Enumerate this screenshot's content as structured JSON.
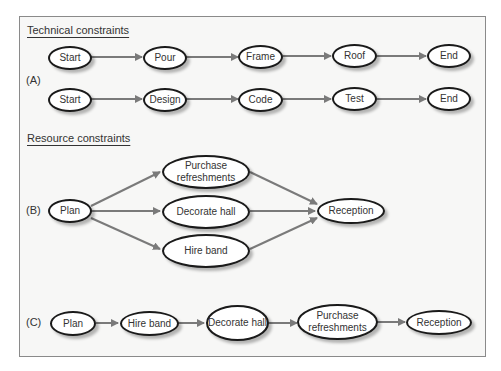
{
  "headers": {
    "technical": "Technical constraints",
    "resource": "Resource constraints"
  },
  "section_labels": {
    "a": "(A)",
    "b": "(B)",
    "c": "(C)"
  },
  "colors": {
    "arrow": "#7a7a7a",
    "node_border": "#1a1a1a",
    "panel_bg": "#f7f7f6"
  },
  "diagram_a": {
    "row1": [
      "Start",
      "Pour",
      "Frame",
      "Roof",
      "End"
    ],
    "row2": [
      "Start",
      "Design",
      "Code",
      "Test",
      "End"
    ]
  },
  "diagram_b": {
    "start": "Plan",
    "parallel": [
      "Purchase refreshments",
      "Decorate hall",
      "Hire band"
    ],
    "end": "Reception"
  },
  "diagram_c": {
    "sequence": [
      "Plan",
      "Hire band",
      "Decorate hall",
      "Purchase refreshments",
      "Reception"
    ]
  }
}
